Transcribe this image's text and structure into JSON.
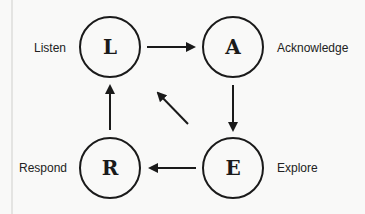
{
  "diagram": {
    "nodes": [
      {
        "id": "L",
        "letter": "L",
        "label": "Listen"
      },
      {
        "id": "A",
        "letter": "A",
        "label": "Acknowledge"
      },
      {
        "id": "E",
        "letter": "E",
        "label": "Explore"
      },
      {
        "id": "R",
        "letter": "R",
        "label": "Respond"
      }
    ],
    "edges": [
      {
        "from": "L",
        "to": "A"
      },
      {
        "from": "A",
        "to": "E"
      },
      {
        "from": "E",
        "to": "R"
      },
      {
        "from": "R",
        "to": "L"
      },
      {
        "from": "E",
        "to": "L",
        "style": "diagonal-short"
      }
    ],
    "colors": {
      "stroke": "#1a1a1a",
      "background": "#f9f9f8"
    }
  }
}
